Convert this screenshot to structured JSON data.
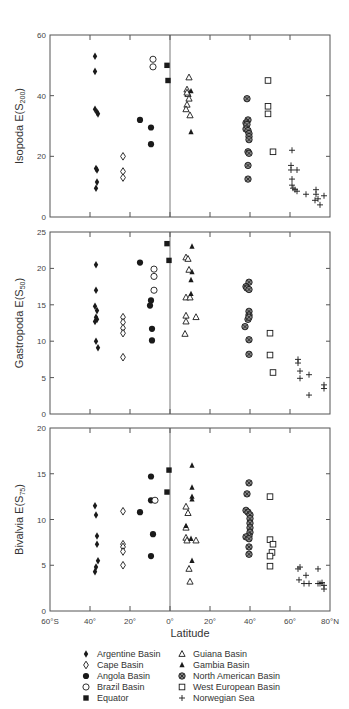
{
  "chart_data": [
    {
      "type": "scatter",
      "title": "",
      "ylabel": "Isopoda E(S200)",
      "ylabel_main": "Isopoda E(S",
      "ylabel_sub": "200",
      "ylabel_end": ")",
      "xlabel": "",
      "ylim": [
        0,
        60
      ],
      "yticks": [
        0,
        20,
        40,
        60
      ],
      "xlim": [
        -60,
        80
      ],
      "series": [
        {
          "name": "Argentine Basin",
          "marker": "thin-diamond-filled",
          "points": [
            [
              -37.5,
              53
            ],
            [
              -37.5,
              48
            ],
            [
              -37.5,
              35.5
            ],
            [
              -36.5,
              34.5
            ],
            [
              -36,
              34
            ],
            [
              -37,
              16
            ],
            [
              -36.5,
              15.5
            ],
            [
              -36.5,
              11.5
            ],
            [
              -37,
              9.5
            ]
          ]
        },
        {
          "name": "Cape Basin",
          "marker": "diamond-open",
          "points": [
            [
              -23.5,
              20
            ],
            [
              -23.5,
              15
            ],
            [
              -23.5,
              13
            ]
          ]
        },
        {
          "name": "Angola Basin",
          "marker": "circle-filled",
          "points": [
            [
              -15,
              32
            ],
            [
              -9.5,
              29.5
            ],
            [
              -9.5,
              24
            ]
          ]
        },
        {
          "name": "Brazil Basin",
          "marker": "circle-open",
          "points": [
            [
              -8.5,
              52
            ],
            [
              -8.5,
              49.5
            ]
          ]
        },
        {
          "name": "Equator",
          "marker": "square-filled",
          "points": [
            [
              -1.5,
              50
            ],
            [
              -1,
              45
            ]
          ]
        },
        {
          "name": "Guiana Basin",
          "marker": "triangle-open",
          "points": [
            [
              9.5,
              46
            ],
            [
              8.5,
              42
            ],
            [
              9,
              40.5
            ],
            [
              9.5,
              39
            ],
            [
              8.5,
              37
            ],
            [
              8,
              35.5
            ],
            [
              10,
              33.5
            ],
            [
              8.5,
              41
            ]
          ]
        },
        {
          "name": "Gambia Basin",
          "marker": "triangle-filled",
          "points": [
            [
              10.5,
              41.5
            ],
            [
              10.5,
              28
            ]
          ]
        },
        {
          "name": "North American Basin",
          "marker": "circle-cross",
          "points": [
            [
              38.5,
              39
            ],
            [
              39,
              32
            ],
            [
              38,
              31
            ],
            [
              38.5,
              30.5
            ],
            [
              38,
              29
            ],
            [
              39,
              28.5
            ],
            [
              39.5,
              27.5
            ],
            [
              39.5,
              26.5
            ],
            [
              39.5,
              25.5
            ],
            [
              39,
              21.5
            ],
            [
              39.5,
              21
            ],
            [
              39,
              17
            ],
            [
              39,
              12.5
            ]
          ]
        },
        {
          "name": "West European Basin",
          "marker": "square-open",
          "points": [
            [
              49,
              45
            ],
            [
              49,
              36.5
            ],
            [
              49,
              34
            ],
            [
              51.5,
              21.5
            ]
          ]
        },
        {
          "name": "Norwegian Sea",
          "marker": "plus",
          "points": [
            [
              61,
              22
            ],
            [
              60.5,
              17
            ],
            [
              60.5,
              15.5
            ],
            [
              63.5,
              15.5
            ],
            [
              61,
              12.5
            ],
            [
              61,
              10.5
            ],
            [
              61.5,
              9.5
            ],
            [
              62.5,
              9
            ],
            [
              63.5,
              8.5
            ],
            [
              68,
              7.5
            ],
            [
              73,
              9
            ],
            [
              73,
              7.5
            ],
            [
              72.5,
              5.5
            ],
            [
              74,
              6
            ],
            [
              75,
              4
            ],
            [
              77,
              7
            ]
          ]
        }
      ]
    },
    {
      "type": "scatter",
      "title": "",
      "ylabel": "Gastropoda E(S50)",
      "ylabel_main": "Gastropoda E(S",
      "ylabel_sub": "50",
      "ylabel_end": ")",
      "xlabel": "",
      "ylim": [
        0,
        25
      ],
      "yticks": [
        0,
        5,
        10,
        15,
        20,
        25
      ],
      "xlim": [
        -60,
        80
      ],
      "series": [
        {
          "name": "Argentine Basin",
          "marker": "thin-diamond-filled",
          "points": [
            [
              -37,
              20.5
            ],
            [
              -37,
              17
            ],
            [
              -37.5,
              14.8
            ],
            [
              -36.5,
              14.2
            ],
            [
              -37,
              13.3
            ],
            [
              -36.5,
              13
            ],
            [
              -37.5,
              12.7
            ],
            [
              -37,
              10
            ],
            [
              -36,
              9.1
            ]
          ]
        },
        {
          "name": "Cape Basin",
          "marker": "diamond-open",
          "points": [
            [
              -23.5,
              13.3
            ],
            [
              -23.5,
              12.6
            ],
            [
              -23.5,
              11.8
            ],
            [
              -23.5,
              11.1
            ],
            [
              -23.5,
              7.8
            ]
          ]
        },
        {
          "name": "Angola Basin",
          "marker": "circle-filled",
          "points": [
            [
              -15,
              20.8
            ],
            [
              -9.5,
              15.6
            ],
            [
              -10,
              14.9
            ],
            [
              -9,
              11.7
            ],
            [
              -9,
              10.1
            ]
          ]
        },
        {
          "name": "Brazil Basin",
          "marker": "circle-open",
          "points": [
            [
              -8,
              19.9
            ],
            [
              -8,
              18.9
            ],
            [
              -8,
              17
            ]
          ]
        },
        {
          "name": "Equator",
          "marker": "square-filled",
          "points": [
            [
              -1.5,
              23.4
            ],
            [
              -0.5,
              21.1
            ]
          ]
        },
        {
          "name": "Guiana Basin",
          "marker": "triangle-open",
          "points": [
            [
              8,
              21.5
            ],
            [
              9,
              21.3
            ],
            [
              9.5,
              19.8
            ],
            [
              8,
              16
            ],
            [
              10,
              16
            ],
            [
              8,
              13.5
            ],
            [
              13,
              13.3
            ],
            [
              8,
              12.7
            ],
            [
              7.5,
              11
            ]
          ]
        },
        {
          "name": "Gambia Basin",
          "marker": "triangle-filled",
          "points": [
            [
              11,
              23
            ],
            [
              11,
              19.5
            ],
            [
              10.5,
              18.4
            ],
            [
              10.5,
              16.5
            ]
          ]
        },
        {
          "name": "North American Basin",
          "marker": "circle-cross",
          "points": [
            [
              39.5,
              18.1
            ],
            [
              38,
              17.5
            ],
            [
              38.5,
              17.3
            ],
            [
              39.5,
              17.1
            ],
            [
              39.5,
              14.1
            ],
            [
              39.5,
              13.6
            ],
            [
              39,
              13
            ],
            [
              39.5,
              13.3
            ],
            [
              37.5,
              12
            ],
            [
              39.5,
              10.2
            ],
            [
              39.5,
              8.2
            ]
          ]
        },
        {
          "name": "West European Basin",
          "marker": "square-open",
          "points": [
            [
              50,
              11.1
            ],
            [
              50,
              8.1
            ],
            [
              51.5,
              5.7
            ]
          ]
        },
        {
          "name": "Norwegian Sea",
          "marker": "plus",
          "points": [
            [
              64,
              7.5
            ],
            [
              64,
              7
            ],
            [
              65,
              5.9
            ],
            [
              65,
              4.9
            ],
            [
              69.5,
              5.4
            ],
            [
              69.5,
              2.6
            ],
            [
              77,
              4
            ],
            [
              77,
              3.5
            ]
          ]
        }
      ]
    },
    {
      "type": "scatter",
      "title": "",
      "ylabel": "Bivalvia E(S75)",
      "ylabel_main": "Bivalvia E(S",
      "ylabel_sub": "75",
      "ylabel_end": ")",
      "xlabel": "Latitude",
      "ylim": [
        0,
        20
      ],
      "yticks": [
        0,
        5,
        10,
        15,
        20
      ],
      "xlim": [
        -60,
        80
      ],
      "xticks": [
        -60,
        -40,
        -20,
        0,
        20,
        40,
        60,
        80
      ],
      "xticklabels": [
        "60°S",
        "40°",
        "20°",
        "0°",
        "20°",
        "40°",
        "60°",
        "80°N"
      ],
      "series": [
        {
          "name": "Argentine Basin",
          "marker": "thin-diamond-filled",
          "points": [
            [
              -37.5,
              11.5
            ],
            [
              -37,
              10.5
            ],
            [
              -36.5,
              8.2
            ],
            [
              -36.5,
              7.3
            ],
            [
              -36,
              5.5
            ],
            [
              -37,
              4.8
            ],
            [
              -37.5,
              4.3
            ]
          ]
        },
        {
          "name": "Cape Basin",
          "marker": "diamond-open",
          "points": [
            [
              -23.5,
              10.9
            ],
            [
              -23.5,
              7.3
            ],
            [
              -23.5,
              7
            ],
            [
              -23.5,
              6.5
            ],
            [
              -23.5,
              5
            ]
          ]
        },
        {
          "name": "Angola Basin",
          "marker": "circle-filled",
          "points": [
            [
              -15,
              10.8
            ],
            [
              -9.5,
              14.7
            ],
            [
              -9.5,
              12.1
            ],
            [
              -8.5,
              8.4
            ],
            [
              -9.5,
              6
            ]
          ]
        },
        {
          "name": "Brazil Basin",
          "marker": "circle-open",
          "points": [
            [
              -7.5,
              12.1
            ]
          ]
        },
        {
          "name": "Equator",
          "marker": "square-filled",
          "points": [
            [
              -0.5,
              15.4
            ],
            [
              -1.5,
              13
            ]
          ]
        },
        {
          "name": "Guiana Basin",
          "marker": "triangle-open",
          "points": [
            [
              8,
              11.4
            ],
            [
              9,
              10.7
            ],
            [
              8,
              9.1
            ],
            [
              8,
              8
            ],
            [
              8.5,
              7.7
            ],
            [
              13,
              7.7
            ],
            [
              9.5,
              4.6
            ],
            [
              10,
              3.2
            ]
          ]
        },
        {
          "name": "Gambia Basin",
          "marker": "triangle-filled",
          "points": [
            [
              11,
              15.9
            ],
            [
              11,
              13.5
            ],
            [
              11,
              12.5
            ],
            [
              11,
              12.2
            ],
            [
              8,
              9.3
            ],
            [
              10.5,
              7.9
            ],
            [
              11,
              5.5
            ]
          ]
        },
        {
          "name": "North American Basin",
          "marker": "circle-cross",
          "points": [
            [
              39.5,
              14
            ],
            [
              38.5,
              12.8
            ],
            [
              38,
              11
            ],
            [
              39,
              10.8
            ],
            [
              40,
              10.5
            ],
            [
              40,
              10.1
            ],
            [
              40,
              9.6
            ],
            [
              40,
              9.1
            ],
            [
              40,
              8.6
            ],
            [
              39.5,
              8.2
            ],
            [
              38,
              8.1
            ],
            [
              39.5,
              7.9
            ],
            [
              39.5,
              7
            ],
            [
              39.5,
              6.2
            ]
          ]
        },
        {
          "name": "West European Basin",
          "marker": "square-open",
          "points": [
            [
              50,
              12.5
            ],
            [
              50,
              7.8
            ],
            [
              51.5,
              7.3
            ],
            [
              51,
              6.4
            ],
            [
              50,
              6
            ],
            [
              50,
              4.9
            ]
          ]
        },
        {
          "name": "Norwegian Sea",
          "marker": "plus",
          "points": [
            [
              64,
              4.6
            ],
            [
              65,
              4.8
            ],
            [
              64.5,
              3.4
            ],
            [
              67,
              3
            ],
            [
              69.5,
              3
            ],
            [
              68,
              3.9
            ],
            [
              74,
              4.6
            ],
            [
              74,
              3
            ],
            [
              75,
              3
            ],
            [
              76,
              3.1
            ],
            [
              77,
              2.8
            ],
            [
              77,
              2.4
            ]
          ]
        }
      ]
    }
  ],
  "xaxis": {
    "title": "Latitude",
    "ticks": [
      -60,
      -40,
      -20,
      0,
      20,
      40,
      60,
      80
    ],
    "labels": [
      "60°S",
      "40°",
      "20°",
      "0°",
      "20°",
      "40°",
      "60°",
      "80°N"
    ]
  },
  "legend": {
    "left": [
      {
        "label": "Argentine Basin",
        "marker": "thin-diamond-filled"
      },
      {
        "label": "Cape Basin",
        "marker": "diamond-open"
      },
      {
        "label": "Angola Basin",
        "marker": "circle-filled"
      },
      {
        "label": "Brazil Basin",
        "marker": "circle-open"
      },
      {
        "label": "Equator",
        "marker": "square-filled"
      }
    ],
    "right": [
      {
        "label": "Guiana Basin",
        "marker": "triangle-open"
      },
      {
        "label": "Gambia Basin",
        "marker": "triangle-filled"
      },
      {
        "label": "North American Basin",
        "marker": "circle-cross"
      },
      {
        "label": "West European Basin",
        "marker": "square-open"
      },
      {
        "label": "Norwegian Sea",
        "marker": "plus"
      }
    ]
  },
  "colors": {
    "ink": "#1a1a1a",
    "axis": "#555555",
    "background": "#ffffff"
  }
}
